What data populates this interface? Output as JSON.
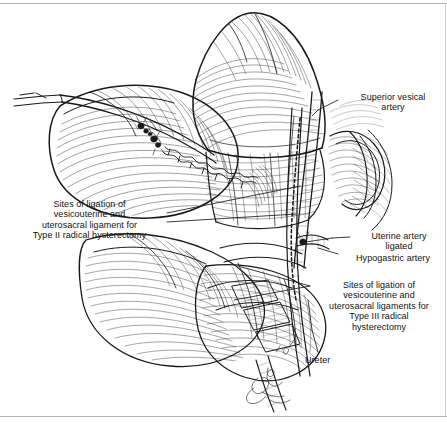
{
  "figure": {
    "kind": "medical-surgical-illustration",
    "ink_color": "#1a1a1a",
    "background_color": "#ffffff",
    "frame_color": "#b4b4b6"
  },
  "labels": {
    "superior_vesical_artery": "Superior vesical\nartery",
    "type2_ligation": "Sites of ligation of\nvesicouterine and\nuterosacral ligament for\nType II radical hysterectomy",
    "uterine_artery_ligated": "Uterine artery\nligated",
    "hypogastric_artery": "Hypogastric artery",
    "type3_ligation": "Sites of ligation of\nvesicouterine and\nuterosacral ligaments for\nType III radical\nhysterectomy",
    "ureter": "Ureter"
  }
}
